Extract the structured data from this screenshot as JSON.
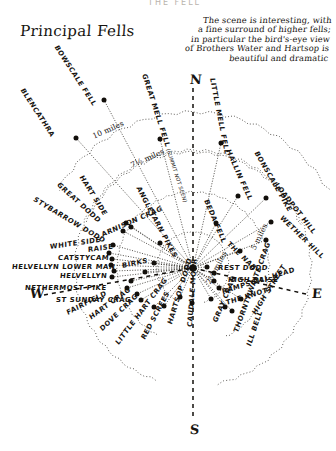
{
  "page": {
    "top_cut_text": "THE FELL",
    "title": "Principal Fells",
    "note_lines": [
      "The scene is interesting, with",
      "a fine surround of higher fells;",
      "in particular the bird's-eye view",
      "of Brothers Water and Hartsop is",
      "beautiful and dramatic"
    ]
  },
  "compass": {
    "north": "N",
    "south": "S",
    "west": "W",
    "east": "E"
  },
  "rings": [
    {
      "label": "2½ miles",
      "radius": 36,
      "x": 208,
      "y": 279,
      "rot": -62
    },
    {
      "label": "5 miles",
      "radius": 76,
      "x": 253,
      "y": 245,
      "rot": -64
    },
    {
      "label": "7½ miles",
      "radius": 116,
      "x": 131,
      "y": 161,
      "rot": -24
    },
    {
      "label": "10 miles",
      "radius": 156,
      "x": 93,
      "y": 132,
      "rot": -24
    }
  ],
  "center": {
    "x": 193,
    "y": 268
  },
  "fells": [
    {
      "name": "BOWSCALE FELL",
      "rot": 57,
      "lx": 56,
      "ly": 42,
      "px": 104,
      "py": 100,
      "r": 178
    },
    {
      "name": "BLENCATHRA",
      "rot": 57,
      "lx": 22,
      "ly": 85,
      "px": 76,
      "py": 138,
      "r": 175
    },
    {
      "name": "GREAT MELL FELL",
      "sub": "(summit not seen)",
      "rot": 72,
      "lx": 144,
      "ly": 70,
      "px": 160,
      "py": 139,
      "r": 133
    },
    {
      "name": "LITTLE MELL FELL",
      "rot": 79,
      "lx": 212,
      "ly": 74,
      "px": 221,
      "py": 143,
      "r": 136
    },
    {
      "name": "HALLIN FELL",
      "rot": 66,
      "lx": 228,
      "ly": 146,
      "px": 238,
      "py": 196,
      "r": 95
    },
    {
      "name": "BONSCALE PIKE",
      "rot": 60,
      "lx": 256,
      "ly": 148,
      "px": 266,
      "py": 198,
      "r": 98
    },
    {
      "name": "LOADPOT HILL",
      "rot": 52,
      "lx": 276,
      "ly": 180,
      "px": 271,
      "py": 222,
      "r": 89
    },
    {
      "name": "WETHER HILL",
      "rot": 44,
      "lx": 281,
      "ly": 213,
      "px": 266,
      "py": 240,
      "r": 76
    },
    {
      "name": "BEDA FELL",
      "rot": 67,
      "lx": 206,
      "ly": 196,
      "px": 216,
      "py": 223,
      "r": 50
    },
    {
      "name": "THE NAB",
      "rot": 44,
      "lx": 228,
      "ly": 239,
      "px": 240,
      "py": 251,
      "r": 50
    },
    {
      "name": "REST DODD",
      "rot": 0,
      "lx": 218,
      "ly": 264,
      "px": 207,
      "py": 267,
      "r": 15
    },
    {
      "name": "HIGH RAISE",
      "rot": 0,
      "lx": 228,
      "ly": 276,
      "px": 214,
      "py": 273,
      "r": 22
    },
    {
      "name": "RAMPSGILL HEAD",
      "rot": -17,
      "lx": 222,
      "ly": 288,
      "px": 214,
      "py": 281,
      "r": 24
    },
    {
      "name": "THE KNOTT",
      "rot": -17,
      "lx": 226,
      "ly": 299,
      "px": 219,
      "py": 288,
      "r": 35
    },
    {
      "name": "HIGH STREET",
      "rot": -58,
      "lx": 254,
      "ly": 310,
      "px": 241,
      "py": 299,
      "r": 58
    },
    {
      "name": "THORNTHWAITE CRAG",
      "rot": -70,
      "lx": 236,
      "ly": 328,
      "px": 225,
      "py": 307,
      "r": 55
    },
    {
      "name": "ILL BELL",
      "rot": -72,
      "lx": 249,
      "ly": 342,
      "px": 232,
      "py": 311,
      "r": 62
    },
    {
      "name": "GRAY CRAG",
      "rot": -67,
      "lx": 215,
      "ly": 318,
      "px": 211,
      "py": 299,
      "r": 36
    },
    {
      "name": "CAUDALE MOOR",
      "rot": -86,
      "lx": 190,
      "ly": 323,
      "px": 192,
      "py": 303,
      "r": 38
    },
    {
      "name": "HARTSOP DODD",
      "rot": -73,
      "lx": 170,
      "ly": 320,
      "px": 180,
      "py": 297,
      "r": 32
    },
    {
      "name": "RED SCREES",
      "rot": -62,
      "lx": 143,
      "ly": 335,
      "px": 164,
      "py": 306,
      "r": 48
    },
    {
      "name": "LITTLE HART CRAG",
      "rot": -53,
      "lx": 117,
      "ly": 340,
      "px": 154,
      "py": 307,
      "r": 55
    },
    {
      "name": "DOVE CRAG",
      "rot": -44,
      "lx": 101,
      "ly": 326,
      "px": 141,
      "py": 300,
      "r": 60
    },
    {
      "name": "HART CRAG",
      "rot": -36,
      "lx": 90,
      "ly": 314,
      "px": 137,
      "py": 294,
      "r": 62
    },
    {
      "name": "FAIRFIELD",
      "rot": -27,
      "lx": 67,
      "ly": 309,
      "px": 127,
      "py": 288,
      "r": 69
    },
    {
      "name": "ST SUNDAY CRAG",
      "rot": 0,
      "lx": 56,
      "ly": 296,
      "px": 131,
      "py": 281,
      "r": 63
    },
    {
      "name": "NETHERMOST PIKE",
      "rot": 0,
      "lx": 25,
      "ly": 284,
      "px": 112,
      "py": 277,
      "r": 81
    },
    {
      "name": "HELVELLYN",
      "rot": 0,
      "lx": 60,
      "ly": 272,
      "px": 114,
      "py": 271,
      "r": 79
    },
    {
      "name": "HELVELLYN LOWER MAN",
      "rot": 0,
      "lx": 12,
      "ly": 263,
      "px": 111,
      "py": 265,
      "r": 82
    },
    {
      "name": "CATSTYCAM",
      "rot": 0,
      "lx": 58,
      "ly": 254,
      "px": 112,
      "py": 259,
      "r": 82
    },
    {
      "name": "WHITE SIDE",
      "rot": -8,
      "lx": 50,
      "ly": 243,
      "px": 109,
      "py": 253,
      "r": 86
    },
    {
      "name": "RAISE",
      "rot": -8,
      "lx": 88,
      "ly": 246,
      "px": 113,
      "py": 245,
      "r": 84
    },
    {
      "name": "STYBARROW DODD",
      "rot": 31,
      "lx": 34,
      "ly": 195,
      "px": 123,
      "py": 231,
      "r": 80
    },
    {
      "name": "GREAT DODD",
      "rot": 42,
      "lx": 58,
      "ly": 180,
      "px": 126,
      "py": 223,
      "r": 80
    },
    {
      "name": "HART SIDE",
      "rot": 58,
      "lx": 81,
      "ly": 172,
      "px": 131,
      "py": 227,
      "r": 74
    },
    {
      "name": "ARNISON CRAG",
      "rot": -24,
      "lx": 102,
      "ly": 231,
      "px": 154,
      "py": 263,
      "r": 40
    },
    {
      "name": "BIRKS",
      "rot": -12,
      "lx": 122,
      "ly": 262,
      "px": 145,
      "py": 272,
      "r": 48
    },
    {
      "name": "ANGLETARN PIKES",
      "rot": 62,
      "lx": 138,
      "ly": 183,
      "px": 160,
      "py": 243,
      "r": 42
    }
  ]
}
